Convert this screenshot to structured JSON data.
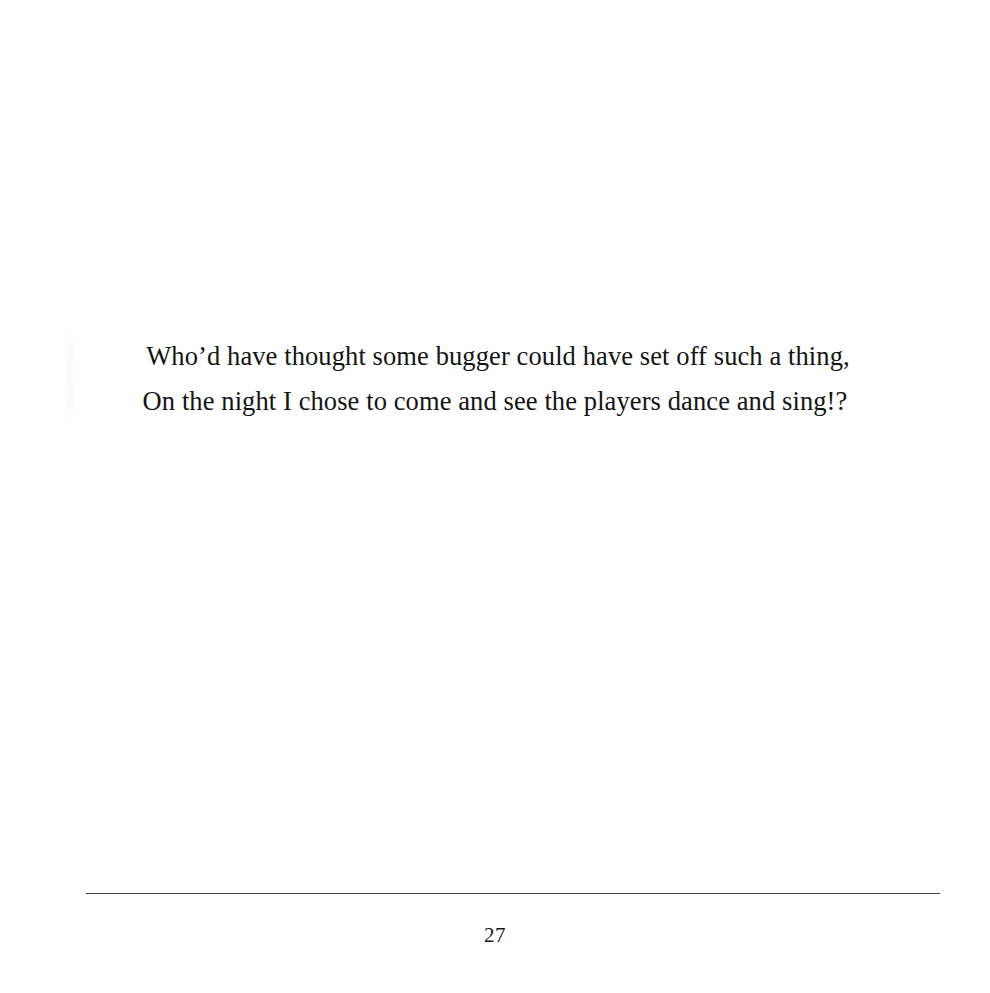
{
  "page": {
    "background_color": "#ffffff",
    "text_color": "#141414",
    "rule_color": "#2e2e2e",
    "width": 990,
    "height": 993
  },
  "body": {
    "verse_lines": [
      "Who’d have thought some bugger could have set off such a thing,",
      "On the night I chose to come and see the players dance and sing!?"
    ]
  },
  "footer": {
    "page_number": "27",
    "rule": "horizontal-rule"
  }
}
